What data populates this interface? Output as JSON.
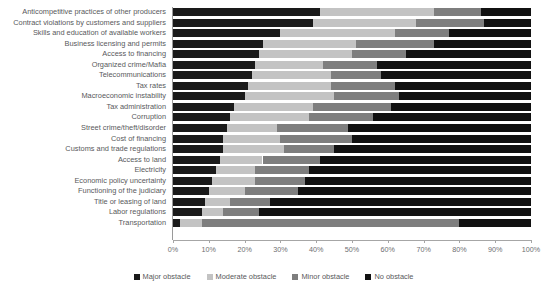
{
  "chart_data": {
    "type": "bar",
    "subtype": "horizontal-stacked-100",
    "title": "",
    "xlabel": "",
    "ylabel": "",
    "xlim": [
      0,
      100
    ],
    "xticks": [
      "0%",
      "10%",
      "20%",
      "30%",
      "40%",
      "50%",
      "60%",
      "70%",
      "80%",
      "90%",
      "100%"
    ],
    "xtick_values": [
      0,
      10,
      20,
      30,
      40,
      50,
      60,
      70,
      80,
      90,
      100
    ],
    "grid": false,
    "legend_position": "bottom-center",
    "categories": [
      "Anticompetitive practices of other producers",
      "Contract violations by customers and suppliers",
      "Skills and education of available workers",
      "Business licensing and permits",
      "Access to financing",
      "Organized crime/Mafia",
      "Telecommunications",
      "Tax rates",
      "Macroeconomic instability",
      "Tax administration",
      "Corruption",
      "Street crime/theft/disorder",
      "Cost of financing",
      "Customs and trade regulations",
      "Access to land",
      "Electricity",
      "Economic policy uncertainty",
      "Functioning of the judiciary",
      "Title or leasing of land",
      "Labor regulations",
      "Transportation"
    ],
    "series": [
      {
        "name": "Major obstacle",
        "color": "#1a1a1a",
        "values": [
          41,
          39,
          30,
          25,
          24,
          23,
          22,
          21,
          20,
          17,
          16,
          15,
          14,
          14,
          13,
          12,
          11,
          10,
          9,
          8,
          2
        ]
      },
      {
        "name": "Moderate obstacle",
        "color": "#c3c3c3",
        "values": [
          32,
          29,
          32,
          26,
          26,
          19,
          22,
          23,
          25,
          22,
          22,
          14,
          16,
          17,
          12,
          11,
          12,
          10,
          7,
          6,
          6
        ]
      },
      {
        "name": "Minor obstacle",
        "color": "#7e7e7e",
        "values": [
          13,
          19,
          15,
          22,
          15,
          15,
          14,
          18,
          18,
          22,
          18,
          20,
          20,
          14,
          16,
          15,
          14,
          15,
          11,
          10,
          72
        ]
      },
      {
        "name": "No obstacle",
        "color": "#111111",
        "values": [
          14,
          13,
          23,
          27,
          35,
          43,
          42,
          38,
          37,
          39,
          44,
          51,
          50,
          55,
          59,
          62,
          63,
          65,
          73,
          76,
          20
        ]
      }
    ]
  },
  "legend": {
    "items": [
      {
        "label": "Major obstacle",
        "color": "#1a1a1a"
      },
      {
        "label": "Moderate obstacle",
        "color": "#c3c3c3"
      },
      {
        "label": "Minor obstacle",
        "color": "#7e7e7e"
      },
      {
        "label": "No obstacle",
        "color": "#111111"
      }
    ]
  }
}
